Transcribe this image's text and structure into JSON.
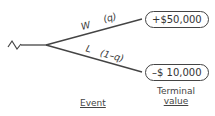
{
  "diagram": {
    "type": "decision-tree",
    "root": {
      "symbol": "chance-node-squiggle"
    },
    "branches": [
      {
        "event": "W",
        "probability": "(q)",
        "terminal_value": "+$50,000"
      },
      {
        "event": "L",
        "probability": "(1–q)",
        "terminal_value": "–$ 10,000"
      }
    ],
    "columns": {
      "event": "Event",
      "terminal_line1": "Terminal",
      "terminal_line2": "value"
    },
    "colors": {
      "line": "#444444",
      "text": "#333333",
      "background": "#ffffff"
    }
  }
}
